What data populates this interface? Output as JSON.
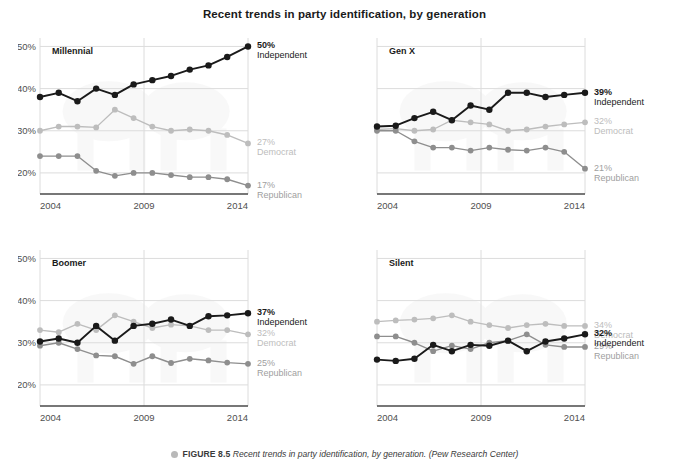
{
  "title": "Recent trends in party identification, by generation",
  "caption": {
    "figure_number": "FIGURE 8.5",
    "text": "Recent trends in party identification, by generation.",
    "source": "(Pew Research Center)"
  },
  "colors": {
    "independent": "#1a1a1a",
    "democrat": "#bdbdbd",
    "republican": "#8e8e8e",
    "grid": "#dcdcdc",
    "axis": "#4a4a4a",
    "tick_label": "#4f4f4f"
  },
  "axis": {
    "y_ticks": [
      "20%",
      "30%",
      "40%",
      "50%"
    ],
    "y_values": [
      20,
      30,
      40,
      50
    ],
    "y_limits": [
      15,
      52
    ],
    "x_ticks": [
      "2004",
      "2009",
      "2014"
    ],
    "x_tick_values": [
      2004,
      2009,
      2014
    ],
    "x_limits": [
      2004,
      2014
    ],
    "y_labels_shown_on": "left-column-only",
    "grid": true
  },
  "series_names": [
    "Independent",
    "Democrat",
    "Republican"
  ],
  "chart_data": {
    "type": "line",
    "title": "Recent trends in party identification, by generation",
    "xlabel": "",
    "ylabel": "",
    "ylim": [
      15,
      52
    ],
    "xlim": [
      2004,
      2014
    ],
    "grid": true,
    "legend": "end-of-line labels",
    "x": [
      2004,
      2004.9,
      2005.8,
      2006.7,
      2007.6,
      2008.5,
      2009.4,
      2010.3,
      2011.2,
      2012.1,
      2013.0,
      2014
    ],
    "panels": [
      {
        "name": "Millennial",
        "position": "top-left",
        "series": [
          {
            "name": "Independent",
            "color": "#1a1a1a",
            "values": [
              38,
              39,
              37,
              40,
              38.5,
              41,
              42,
              43,
              44.5,
              45.5,
              47.5,
              50
            ],
            "end_label_value": "50%",
            "end_label_name": "Independent"
          },
          {
            "name": "Democrat",
            "color": "#bdbdbd",
            "values": [
              30,
              31,
              31,
              30.8,
              35,
              33,
              31,
              30,
              30.3,
              30,
              29,
              27
            ],
            "end_label_value": "27%",
            "end_label_name": "Democrat"
          },
          {
            "name": "Republican",
            "color": "#8e8e8e",
            "values": [
              24,
              24,
              24,
              20.5,
              19.3,
              20,
              20,
              19.5,
              19,
              19,
              18.5,
              17
            ],
            "end_label_value": "17%",
            "end_label_name": "Republican"
          }
        ]
      },
      {
        "name": "Gen X",
        "position": "top-right",
        "series": [
          {
            "name": "Independent",
            "color": "#1a1a1a",
            "values": [
              31,
              31.2,
              33,
              34.5,
              32.5,
              36,
              35,
              39,
              39,
              38,
              38.5,
              39
            ],
            "end_label_value": "39%",
            "end_label_name": "Independent"
          },
          {
            "name": "Democrat",
            "color": "#bdbdbd",
            "values": [
              30.3,
              30.5,
              30,
              30.3,
              32.5,
              32,
              31.5,
              30,
              30.3,
              31,
              31.5,
              32
            ],
            "end_label_value": "32%",
            "end_label_name": "Democrat"
          },
          {
            "name": "Republican",
            "color": "#8e8e8e",
            "values": [
              30,
              30,
              27.5,
              26,
              26,
              25.3,
              26,
              25.5,
              25.3,
              26,
              25,
              21
            ],
            "end_label_value": "21%",
            "end_label_name": "Republican"
          }
        ]
      },
      {
        "name": "Boomer",
        "position": "bottom-left",
        "series": [
          {
            "name": "Independent",
            "color": "#1a1a1a",
            "values": [
              30.3,
              31,
              30,
              34,
              30.5,
              34,
              34.5,
              35.5,
              34,
              36.3,
              36.5,
              37
            ],
            "end_label_value": "37%",
            "end_label_name": "Independent"
          },
          {
            "name": "Democrat",
            "color": "#bdbdbd",
            "values": [
              33,
              32.5,
              34.5,
              33,
              36.5,
              35,
              33.5,
              34.3,
              34,
              33,
              33,
              32
            ],
            "end_label_value": "32%",
            "end_label_name": "Democrat"
          },
          {
            "name": "Republican",
            "color": "#8e8e8e",
            "values": [
              29.3,
              30,
              28.5,
              27,
              26.8,
              25,
              26.8,
              25.2,
              26.2,
              25.8,
              25.3,
              25
            ],
            "end_label_value": "25%",
            "end_label_name": "Republican"
          }
        ]
      },
      {
        "name": "Silent",
        "position": "bottom-right",
        "series": [
          {
            "name": "Independent",
            "color": "#1a1a1a",
            "values": [
              26,
              25.7,
              26.2,
              29.5,
              28,
              29.5,
              29.3,
              30.5,
              28,
              30.3,
              31,
              32
            ],
            "end_label_value": "32%",
            "end_label_name": "Independent"
          },
          {
            "name": "Democrat",
            "color": "#bdbdbd",
            "values": [
              35,
              35.3,
              35.5,
              35.8,
              36.5,
              35,
              34.2,
              33.5,
              34.2,
              34.5,
              34,
              34
            ],
            "end_label_value": "34%",
            "end_label_name": "Democrat"
          },
          {
            "name": "Republican",
            "color": "#8e8e8e",
            "values": [
              31.5,
              31.5,
              30,
              28,
              29.3,
              28.5,
              30,
              30.5,
              32,
              29.5,
              29,
              29
            ],
            "end_label_value": "29%",
            "end_label_name": "Republican"
          }
        ]
      }
    ]
  }
}
